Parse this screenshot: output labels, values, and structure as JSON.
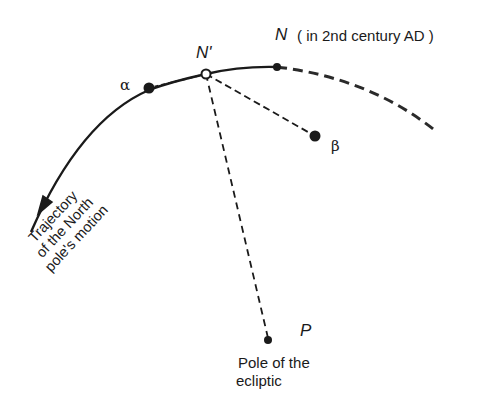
{
  "diagram": {
    "type": "precession-of-north-pole",
    "colors": {
      "ink": "#1a1a1a",
      "background": "#ffffff"
    },
    "points": {
      "alpha": {
        "label": "α",
        "x": 149,
        "y": 88
      },
      "n_prime": {
        "label": "N'",
        "x": 206,
        "y": 74
      },
      "n": {
        "label": "N",
        "note": "( in 2nd century AD )",
        "x": 277,
        "y": 67
      },
      "beta": {
        "label": "β",
        "x": 315,
        "y": 136
      },
      "p": {
        "label": "P",
        "caption_line1": "Pole of the",
        "caption_line2": "ecliptic",
        "x": 268,
        "y": 340
      }
    },
    "trajectory": {
      "line1": "Trajectory",
      "line2": "of the North",
      "line3": "pole's motion"
    }
  }
}
